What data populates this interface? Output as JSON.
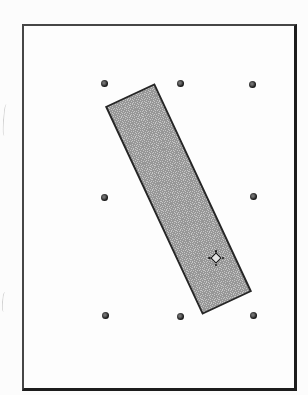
{
  "figure": {
    "background_color": "#fcfcfc"
  },
  "sheet": {
    "left": 22,
    "top": 24,
    "width": 275,
    "height": 367,
    "fill": "#fdfdfd",
    "border_color_light": "#464646",
    "border_color_dark": "#1d1d1d"
  },
  "grid_dots": {
    "diameter": 7,
    "color_outer": "#141414",
    "color_inner": "#707070",
    "positions": [
      {
        "x": 104,
        "y": 83
      },
      {
        "x": 180,
        "y": 83
      },
      {
        "x": 252,
        "y": 84
      },
      {
        "x": 104,
        "y": 197
      },
      {
        "x": 253,
        "y": 196
      },
      {
        "x": 105,
        "y": 315
      },
      {
        "x": 180,
        "y": 316
      },
      {
        "x": 253,
        "y": 315
      }
    ]
  },
  "rectangle": {
    "center_x": 178,
    "center_y": 199,
    "width": 55,
    "height": 230,
    "rotation_deg": -25,
    "fill_light": "#c6c6c6",
    "fill_dark": "#979797",
    "border_color": "#262626",
    "border_width": 2
  },
  "anchor_marker": {
    "x": 216,
    "y": 258,
    "outline_color": "#111111",
    "fill": "#e4e4e4",
    "tick_color": "#1a1a1a"
  },
  "artifacts": [
    {
      "x": 3,
      "y": 104,
      "height": 32
    },
    {
      "x": 2,
      "y": 292,
      "height": 20
    }
  ]
}
